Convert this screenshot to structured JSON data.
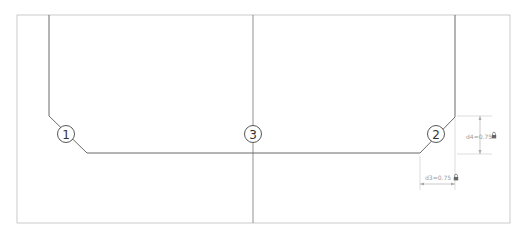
{
  "diagram": {
    "callouts": [
      {
        "id": "1",
        "label": "1"
      },
      {
        "id": "2",
        "label": "2"
      },
      {
        "id": "3",
        "label": "3"
      }
    ],
    "dimensions": {
      "d4": {
        "text": "d4=0.75",
        "icon": "lock-icon"
      },
      "d3": {
        "text": "d3=0.75",
        "icon": "lock-icon"
      }
    },
    "colors": {
      "profile_line": "#555555",
      "frame_line": "#bbbbbb",
      "dimension_line": "#aaaaaa",
      "dimension_text": "#999999",
      "callout": "#333333"
    }
  }
}
